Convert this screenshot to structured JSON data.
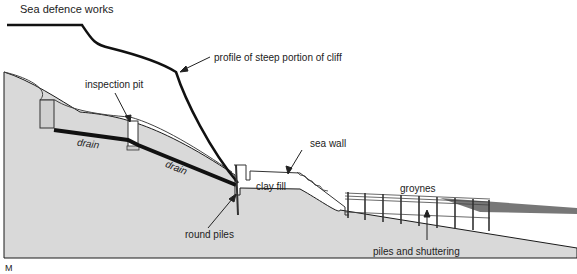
{
  "title": "Sea defence works",
  "labels": {
    "profile": "profile of steep portion of cliff",
    "inspection_pit": "inspection pit",
    "drain_1": "drain",
    "drain_2": "drain",
    "sea_wall": "sea wall",
    "clay_fill": "clay fill",
    "groynes": "groynes",
    "round_piles": "round piles",
    "piles_shuttering": "piles and shuttering",
    "figure_mark": "M"
  },
  "colors": {
    "ground": "#d9d9d9",
    "line": "#1a1a1a",
    "sea": "#777777",
    "background": "#ffffff"
  }
}
